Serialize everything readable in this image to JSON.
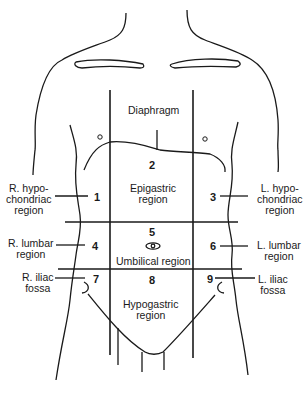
{
  "diagram": {
    "labels": {
      "diaphragm": "Diaphragm",
      "r_hypo": [
        "R. hypo-",
        "chondriac",
        "region"
      ],
      "l_hypo": [
        "L. hypo-",
        "chondriac",
        "region"
      ],
      "epigastric": [
        "Epigastric",
        "region"
      ],
      "r_lumbar": [
        "R. lumbar",
        "region"
      ],
      "l_lumbar": [
        "L. lumbar",
        "region"
      ],
      "umbilical": "Umbilical region",
      "r_iliac": [
        "R. iliac",
        "fossa"
      ],
      "l_iliac": [
        "L. iliac",
        "fossa"
      ],
      "hypogastric": [
        "Hypogastric",
        "region"
      ]
    },
    "numbers": [
      "1",
      "2",
      "3",
      "4",
      "5",
      "6",
      "7",
      "8",
      "9"
    ],
    "line_color": "#1a1a1a"
  }
}
